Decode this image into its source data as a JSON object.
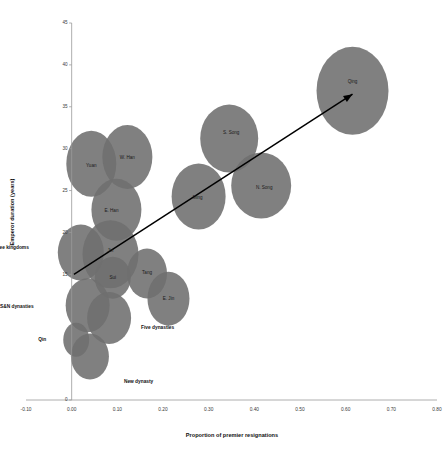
{
  "chart_data": {
    "type": "scatter",
    "title": "",
    "xlabel": "Proportion of premier resignations",
    "ylabel": "Emperor duration (years)",
    "xlim": [
      -0.1,
      0.8
    ],
    "ylim": [
      0,
      45
    ],
    "grid": false,
    "legend": "none",
    "x_ticks": [
      "-0.10",
      "0.00",
      "0.10",
      "0.20",
      "0.30",
      "0.40",
      "0.50",
      "0.60",
      "0.70",
      "0.80"
    ],
    "x_tick_values": [
      -0.1,
      0.0,
      0.1,
      0.2,
      0.3,
      0.4,
      0.5,
      0.6,
      0.7,
      0.8
    ],
    "y_ticks": [
      "0",
      "15",
      "20",
      "25",
      "30",
      "35",
      "40",
      "45"
    ],
    "y_tick_values": [
      0,
      15,
      20,
      25,
      30,
      35,
      40,
      45
    ],
    "marker_color": "#6e6e6e",
    "annotation": {
      "type": "arrow",
      "label": "trend arrow",
      "from": [
        0.005,
        15.0
      ],
      "to": [
        0.615,
        36.5
      ]
    },
    "points": [
      {
        "label": "Qing",
        "x": 0.615,
        "y": 36.9,
        "rx": 36.0,
        "ry": 44.0,
        "label_inside": true,
        "label_dx": 0,
        "label_dy": -9
      },
      {
        "label": "S. Song",
        "x": 0.345,
        "y": 31.2,
        "rx": 29.0,
        "ry": 34.0,
        "label_inside": true,
        "label_dx": 2,
        "label_dy": -6
      },
      {
        "label": "N. Song",
        "x": 0.415,
        "y": 25.6,
        "rx": 30.0,
        "ry": 33.0,
        "label_inside": true,
        "label_dx": 3,
        "label_dy": 2
      },
      {
        "label": "Ming",
        "x": 0.278,
        "y": 24.3,
        "rx": 27.0,
        "ry": 33.0,
        "label_inside": true,
        "label_dx": -1,
        "label_dy": 1
      },
      {
        "label": "Yuan",
        "x": 0.043,
        "y": 28.2,
        "rx": 25.0,
        "ry": 33.0,
        "label_inside": true,
        "label_dx": 0,
        "label_dy": 2
      },
      {
        "label": "W. Han",
        "x": 0.122,
        "y": 29.0,
        "rx": 25.0,
        "ry": 32.0,
        "label_inside": true,
        "label_dx": 0,
        "label_dy": 1
      },
      {
        "label": "E. Han",
        "x": 0.098,
        "y": 22.7,
        "rx": 25.0,
        "ry": 31.0,
        "label_inside": true,
        "label_dx": -5,
        "label_dy": 1
      },
      {
        "label": "Jin",
        "x": 0.085,
        "y": 17.4,
        "rx": 28.0,
        "ry": 34.0,
        "label_inside": true,
        "label_dx": 0,
        "label_dy": -3
      },
      {
        "label": "Sui",
        "x": 0.09,
        "y": 14.6,
        "rx": 18.0,
        "ry": 21.0,
        "label_inside": true,
        "label_dx": 0,
        "label_dy": 0
      },
      {
        "label": "Tang",
        "x": 0.165,
        "y": 15.1,
        "rx": 20.0,
        "ry": 25.0,
        "label_inside": true,
        "label_dx": 0,
        "label_dy": -1
      },
      {
        "label": "E. Jin",
        "x": 0.212,
        "y": 12.1,
        "rx": 21.0,
        "ry": 27.0,
        "label_inside": true,
        "label_dx": 0,
        "label_dy": 0
      },
      {
        "label": "Three kingdoms",
        "x": 0.02,
        "y": 17.6,
        "rx": 23.0,
        "ry": 28.0,
        "label_inside": false,
        "label_dx": -52,
        "label_dy": -5
      },
      {
        "label": "S&N dynasties",
        "x": 0.035,
        "y": 11.3,
        "rx": 22.0,
        "ry": 27.0,
        "label_inside": false,
        "label_dx": -54,
        "label_dy": 1
      },
      {
        "label": "Five dynasties",
        "x": 0.082,
        "y": 9.8,
        "rx": 22.0,
        "ry": 26.0,
        "label_inside": false,
        "label_dx": 32,
        "label_dy": 10
      },
      {
        "label": "Qin",
        "x": 0.01,
        "y": 7.2,
        "rx": 13.0,
        "ry": 17.0,
        "label_inside": false,
        "label_dx": -30,
        "label_dy": 0
      },
      {
        "label": "New dynasty",
        "x": 0.04,
        "y": 5.2,
        "rx": 19.0,
        "ry": 23.0,
        "label_inside": false,
        "label_dx": 34,
        "label_dy": 25
      }
    ]
  }
}
